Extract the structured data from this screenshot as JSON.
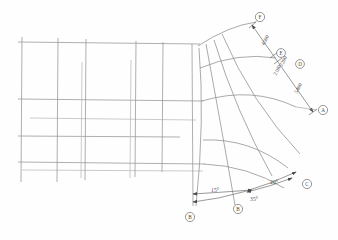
{
  "document": {
    "kind": "engineering-drawing",
    "description": "Plan view of a rectangular grid transitioning into a curved fan-shaped layout with radial dimension lines and angular callouts"
  },
  "grid_bubbles": [
    {
      "id": "bubble-f",
      "label": "F",
      "cx": 260,
      "cy": 17
    },
    {
      "id": "bubble-e",
      "label": "E",
      "cx": 281,
      "cy": 56
    },
    {
      "id": "bubble-d",
      "label": "D",
      "cx": 300,
      "cy": 62
    },
    {
      "id": "bubble-a",
      "label": "A",
      "cx": 322,
      "cy": 110
    },
    {
      "id": "bubble-c",
      "label": "C",
      "cx": 308,
      "cy": 183
    },
    {
      "id": "bubble-b",
      "label": "B",
      "cx": 238,
      "cy": 208
    },
    {
      "id": "bubble-g",
      "label": "B",
      "cx": 189,
      "cy": 216
    }
  ],
  "linear_dimensions": [
    {
      "id": "dim-4500",
      "label": "4500",
      "x": 265,
      "y": 40,
      "rotate": -63
    },
    {
      "id": "dim-2200",
      "label": "2200",
      "x": 281,
      "y": 63,
      "rotate": -63
    },
    {
      "id": "dim-2100",
      "label": "2100",
      "x": 277,
      "y": 69,
      "rotate": -63
    },
    {
      "id": "dim-5400",
      "label": "5400",
      "x": 298,
      "y": 88,
      "rotate": -63
    }
  ],
  "angular_dimensions": [
    {
      "id": "angle-15",
      "label": "15°",
      "x": 215,
      "y": 196
    },
    {
      "id": "angle-35",
      "label": "35°",
      "x": 253,
      "y": 200
    },
    {
      "id": "angle-20",
      "label": "20°",
      "x": 275,
      "y": 183
    }
  ],
  "colors": {
    "background": "#fefefe",
    "line": "#8e8e8e",
    "dimension": "#6e6e6e",
    "text": "#4f4f4f"
  }
}
